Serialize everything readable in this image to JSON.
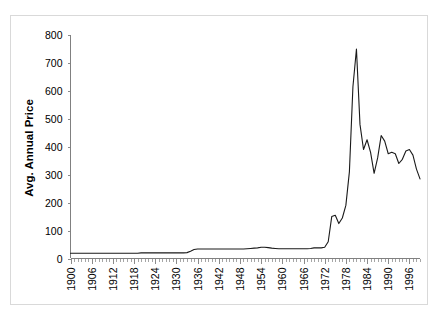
{
  "chart_data": {
    "type": "line",
    "title": "",
    "subtitle": "",
    "xlabel": "",
    "ylabel": "Avg. Annual Price",
    "xlim": [
      1900,
      1999
    ],
    "ylim": [
      0,
      800
    ],
    "grid": false,
    "legend": null,
    "y_ticks": [
      0,
      100,
      200,
      300,
      400,
      500,
      600,
      700,
      800
    ],
    "y_tick_labels": [
      "0",
      "100",
      "200",
      "300",
      "400",
      "500",
      "600",
      "700",
      "800"
    ],
    "x_tick_labels": [
      "1900",
      "1906",
      "1912",
      "1918",
      "1924",
      "1930",
      "1936",
      "1942",
      "1948",
      "1954",
      "1960",
      "1966",
      "1972",
      "1978",
      "1984",
      "1990",
      "1996"
    ],
    "x_tick_step": 6,
    "x_minor_tick_step": 1,
    "series": [
      {
        "name": "Avg. Annual Price",
        "color": "#1a1a1a",
        "x": [
          1900,
          1901,
          1902,
          1903,
          1904,
          1905,
          1906,
          1907,
          1908,
          1909,
          1910,
          1911,
          1912,
          1913,
          1914,
          1915,
          1916,
          1917,
          1918,
          1919,
          1920,
          1921,
          1922,
          1923,
          1924,
          1925,
          1926,
          1927,
          1928,
          1929,
          1930,
          1931,
          1932,
          1933,
          1934,
          1935,
          1936,
          1937,
          1938,
          1939,
          1940,
          1941,
          1942,
          1943,
          1944,
          1945,
          1946,
          1947,
          1948,
          1949,
          1950,
          1951,
          1952,
          1953,
          1954,
          1955,
          1956,
          1957,
          1958,
          1959,
          1960,
          1961,
          1962,
          1963,
          1964,
          1965,
          1966,
          1967,
          1968,
          1969,
          1970,
          1971,
          1972,
          1973,
          1974,
          1975,
          1976,
          1977,
          1978,
          1979,
          1980,
          1981,
          1982,
          1983,
          1984,
          1985,
          1986,
          1987,
          1988,
          1989,
          1990,
          1991,
          1992,
          1993,
          1994,
          1995,
          1996,
          1997,
          1998,
          1999
        ],
        "y": [
          19,
          19,
          19,
          19,
          19,
          19,
          19,
          19,
          19,
          19,
          19,
          19,
          19,
          19,
          19,
          19,
          19,
          19,
          19,
          19,
          20,
          20,
          20,
          20,
          20,
          20,
          20,
          20,
          20,
          20,
          20,
          20,
          20,
          21,
          26,
          32,
          34,
          34,
          34,
          34,
          34,
          34,
          34,
          34,
          34,
          34,
          34,
          34,
          34,
          34,
          35,
          36,
          37,
          38,
          40,
          40,
          39,
          37,
          36,
          35,
          35,
          35,
          35,
          35,
          35,
          35,
          35,
          35,
          36,
          38,
          38,
          38,
          40,
          60,
          150,
          155,
          125,
          145,
          190,
          310,
          615,
          750,
          480,
          390,
          425,
          380,
          305,
          360,
          440,
          420,
          375,
          380,
          375,
          340,
          355,
          385,
          390,
          370,
          320,
          285
        ]
      }
    ]
  },
  "frame": {
    "border_color": "#d9d9d9",
    "background": "#ffffff"
  }
}
